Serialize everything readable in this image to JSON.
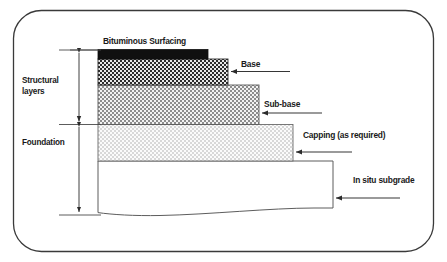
{
  "diagram": {
    "frame": {
      "shape": "rounded-rectangle",
      "stroke": "#3a3a3a"
    },
    "layers": [
      {
        "key": "bituminous",
        "label": "Bituminous Surfacing",
        "fill": "solid-black",
        "color": "#111111",
        "group": "structural"
      },
      {
        "key": "base",
        "label": "Base",
        "fill": "dense-checker",
        "color": "#3f3f3f",
        "group": "structural"
      },
      {
        "key": "subbase",
        "label": "Sub-base",
        "fill": "medium-checker",
        "color": "#8a8a8a",
        "group": "structural"
      },
      {
        "key": "capping",
        "label": "Capping (as required)",
        "fill": "light-speckle",
        "color": "#d2d2d2",
        "group": "foundation"
      },
      {
        "key": "subgrade",
        "label": "In situ subgrade",
        "fill": "none",
        "color": "#ffffff",
        "group": "foundation"
      }
    ],
    "brackets": [
      {
        "key": "structural",
        "label_line1": "Structural",
        "label_line2": "layers"
      },
      {
        "key": "foundation",
        "label_line1": "Foundation",
        "label_line2": ""
      }
    ]
  }
}
